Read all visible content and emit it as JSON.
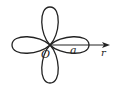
{
  "diagram": {
    "type": "polar-rose",
    "curve": "four-leaf rose (r = a cos 2θ)",
    "petals": 4,
    "labels": {
      "origin": "O",
      "amplitude": "a",
      "axis": "r"
    },
    "colors": {
      "stroke": "#222222",
      "background": "#ffffff"
    }
  }
}
